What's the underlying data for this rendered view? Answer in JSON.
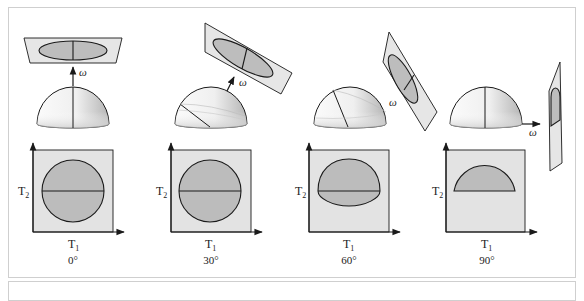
{
  "figure": {
    "panels": [
      {
        "id": "panel-0",
        "angle_label": "0°",
        "x_axis_label": "T",
        "x_axis_sub": "1",
        "y_axis_label": "T",
        "y_axis_sub": "2",
        "vector_label": "ω",
        "projection_shape": "full-circle"
      },
      {
        "id": "panel-30",
        "angle_label": "30°",
        "x_axis_label": "T",
        "x_axis_sub": "1",
        "y_axis_label": "T",
        "y_axis_sub": "2",
        "vector_label": "ω",
        "projection_shape": "full-circle"
      },
      {
        "id": "panel-60",
        "angle_label": "60°",
        "x_axis_label": "T",
        "x_axis_sub": "1",
        "y_axis_label": "T",
        "y_axis_sub": "2",
        "vector_label": "ω",
        "projection_shape": "truncated-ellipse"
      },
      {
        "id": "panel-90",
        "angle_label": "90°",
        "x_axis_label": "T",
        "x_axis_sub": "1",
        "y_axis_label": "T",
        "y_axis_sub": "2",
        "vector_label": "ω",
        "projection_shape": "semicircle"
      }
    ],
    "colors": {
      "line": "#1a1a1a",
      "plane_fill": "#e6e6e6",
      "ellipse_fill": "#bdbdbd",
      "box_fill": "#e3e3e3",
      "region_fill": "#bcbcbc",
      "hemisphere_light": "#f4f4f4",
      "hemisphere_shade": "#b8b8b8",
      "frame_border": "#cfcfcf"
    }
  }
}
